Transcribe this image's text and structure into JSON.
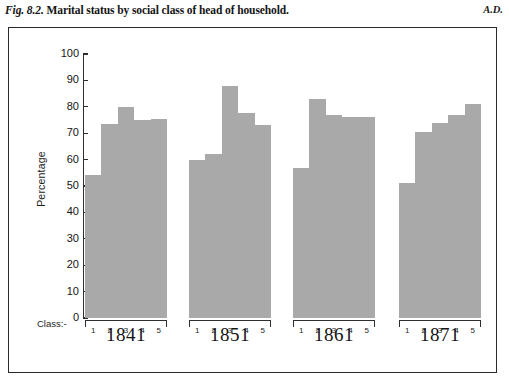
{
  "caption": {
    "figure_number": "Fig. 8.2.",
    "text": "Marital status by social class of head of household.",
    "side_note": "A.D."
  },
  "axes": {
    "ylabel": "Percentage",
    "class_caption": "Class:-",
    "yticks": [
      "0",
      "10",
      "20",
      "30",
      "40",
      "50",
      "60",
      "70",
      "80",
      "90",
      "100"
    ],
    "class_ticks": [
      "1",
      "2",
      "3",
      "4",
      "5"
    ]
  },
  "colors": {
    "bar_fill": "#a9a9a9",
    "axis": "#2f2f2f",
    "frame": "#2b2b2b",
    "text": "#141414",
    "background": "#ffffff"
  },
  "chart_data": {
    "type": "bar",
    "title": "Marital status by social class of head of household",
    "xlabel": "Class:-",
    "ylabel": "Percentage",
    "ylim": [
      0,
      100
    ],
    "ytick_step": 10,
    "grid": false,
    "legend": "none",
    "categories": [
      "1",
      "2",
      "3",
      "4",
      "5"
    ],
    "groups": [
      "1841",
      "1851",
      "1861",
      "1871"
    ],
    "series": [
      {
        "name": "1841",
        "values": [
          54,
          73.5,
          80,
          75,
          75.5
        ]
      },
      {
        "name": "1851",
        "values": [
          60,
          62,
          88,
          77.5,
          73
        ]
      },
      {
        "name": "1861",
        "values": [
          57,
          83,
          77,
          76,
          76
        ]
      },
      {
        "name": "1871",
        "values": [
          51,
          70.5,
          74,
          77,
          81
        ]
      }
    ]
  }
}
